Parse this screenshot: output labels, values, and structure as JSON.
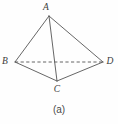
{
  "figure": {
    "caption": "(a)",
    "shape_name": "tetrahedron",
    "background_color": "#fefefe",
    "line_color": "#555555",
    "label_color": "#3b3b3b",
    "vertices": [
      {
        "id": "A",
        "label": "A",
        "x": 49,
        "y": 16,
        "label_x": 46,
        "label_y": 8
      },
      {
        "id": "B",
        "label": "B",
        "x": 15,
        "y": 62,
        "label_x": 5,
        "label_y": 62
      },
      {
        "id": "C",
        "label": "C",
        "x": 57,
        "y": 81,
        "label_x": 57,
        "label_y": 90
      },
      {
        "id": "D",
        "label": "D",
        "x": 103,
        "y": 62,
        "label_x": 110,
        "label_y": 62
      }
    ],
    "edges": [
      {
        "id": "AB",
        "from": "A",
        "to": "B",
        "style": "solid"
      },
      {
        "id": "AD",
        "from": "A",
        "to": "D",
        "style": "solid"
      },
      {
        "id": "AC",
        "from": "A",
        "to": "C",
        "style": "solid"
      },
      {
        "id": "BC",
        "from": "B",
        "to": "C",
        "style": "solid"
      },
      {
        "id": "CD",
        "from": "C",
        "to": "D",
        "style": "solid"
      },
      {
        "id": "BD",
        "from": "B",
        "to": "D",
        "style": "dashed"
      }
    ]
  }
}
